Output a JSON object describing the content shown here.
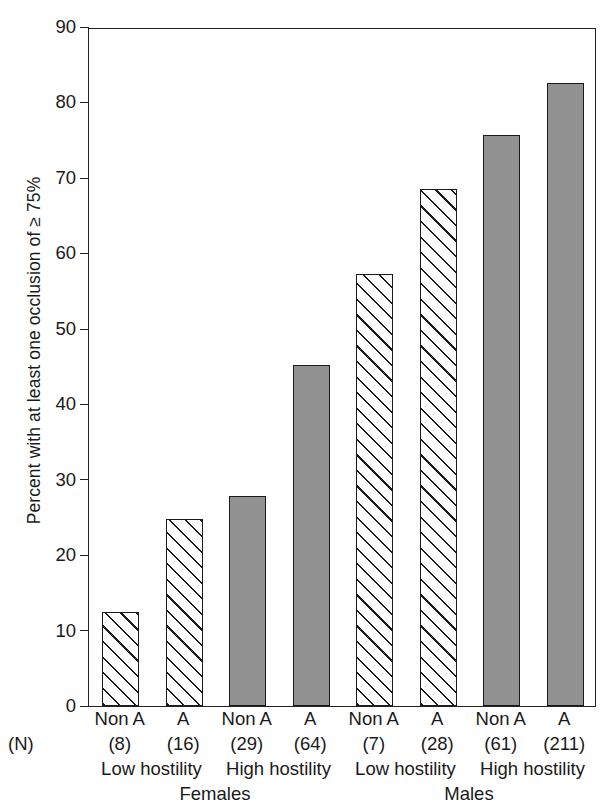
{
  "chart_data": {
    "type": "bar",
    "title": "",
    "xlabel": "",
    "ylabel": "Percent with at least one occlusion of ≥ 75%",
    "ylim": [
      0,
      90
    ],
    "yticks": [
      0,
      10,
      20,
      30,
      40,
      50,
      60,
      70,
      80,
      90
    ],
    "grid": false,
    "legend": "none",
    "n_row_label": "(N)",
    "categories": [
      "Non A",
      "A",
      "Non A",
      "A",
      "Non A",
      "A",
      "Non A",
      "A"
    ],
    "values": [
      12.4,
      24.8,
      27.8,
      45.2,
      57.2,
      68.5,
      75.7,
      82.6
    ],
    "n_values": [
      "(8)",
      "(16)",
      "(29)",
      "(64)",
      "(7)",
      "(28)",
      "(61)",
      "(211)"
    ],
    "patterns": [
      "hatch",
      "hatch",
      "solid",
      "solid",
      "hatch",
      "hatch",
      "solid",
      "solid"
    ],
    "hostility_groups": [
      "Low hostility",
      "High hostility",
      "Low hostility",
      "High hostility"
    ],
    "sex_groups": [
      "Females",
      "Males"
    ],
    "colors": {
      "solid_fill": "#919191",
      "hatch_fill": "#ffffff",
      "outline": "#1a1a1a",
      "axis": "#222222",
      "background": "#ffffff"
    }
  }
}
